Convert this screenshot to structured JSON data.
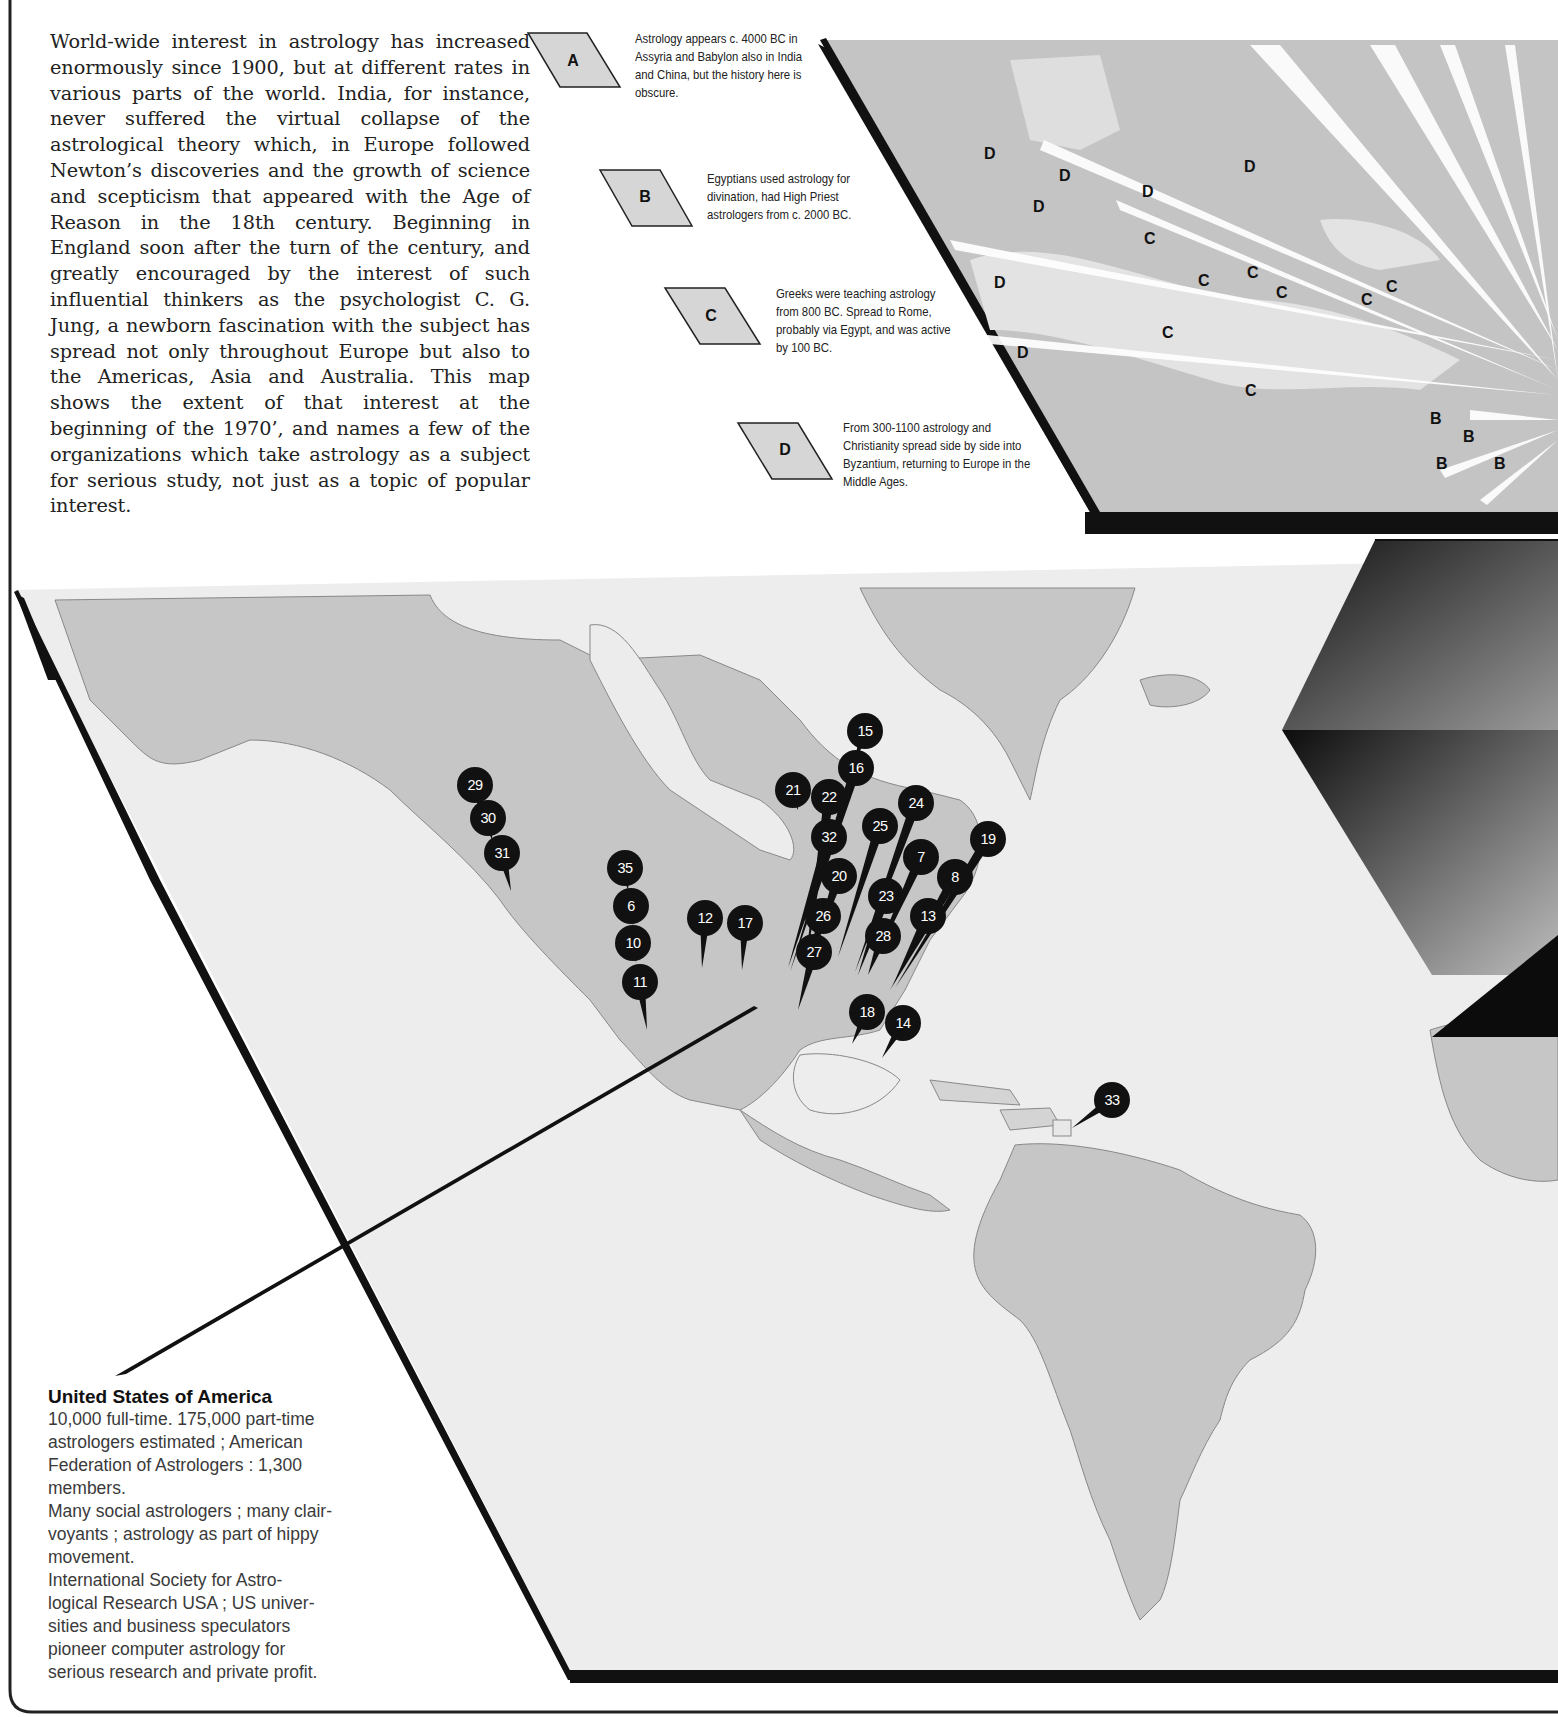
{
  "intro": {
    "paragraph": "World-wide interest in astrology has increased enormously since 1900, but at different rates in various parts of the world. India, for instance, never suffered the virtual collapse of the astrological theory which, in Europe followed Newton’s discoveries and the growth of science and scepticism that appeared with the Age of Reason in the 18th century. Beginning in England soon after the turn of the century, and greatly encouraged by the interest of such influential thinkers as the psychologist C. G. Jung, a newborn fascination with the subject has spread not only throughout Europe but also to the Americas, Asia and Australia. This map shows the extent of that interest at the beginning of the 1970’, and names a few of the organizations which take astrology as a subject for serious study, not just as a topic of popular interest."
  },
  "key": [
    {
      "letter": "A",
      "text": "Astrology appears c. 4000 BC in Assyria and Babylon also in India and China, but the history here is obscure."
    },
    {
      "letter": "B",
      "text": "Egyptians used astrology for divination, had High Priest astrologers from c. 2000 BC."
    },
    {
      "letter": "C",
      "text": "Greeks were teaching astrology from 800 BC. Spread to Rome, probably via Egypt, and was active by 100 BC."
    },
    {
      "letter": "D",
      "text": "From 300-1100 astrology and Christianity spread side by side into Byzantium, returning to Europe in the Middle Ages."
    }
  ],
  "europe_map": {
    "labels": [
      {
        "letter": "D",
        "x": 990,
        "y": 155
      },
      {
        "letter": "D",
        "x": 1065,
        "y": 177
      },
      {
        "letter": "D",
        "x": 1148,
        "y": 193
      },
      {
        "letter": "D",
        "x": 1039,
        "y": 208
      },
      {
        "letter": "D",
        "x": 1250,
        "y": 168
      },
      {
        "letter": "D",
        "x": 1000,
        "y": 284
      },
      {
        "letter": "D",
        "x": 1023,
        "y": 354
      },
      {
        "letter": "C",
        "x": 1150,
        "y": 240
      },
      {
        "letter": "C",
        "x": 1204,
        "y": 282
      },
      {
        "letter": "C",
        "x": 1253,
        "y": 274
      },
      {
        "letter": "C",
        "x": 1282,
        "y": 294
      },
      {
        "letter": "C",
        "x": 1367,
        "y": 301
      },
      {
        "letter": "C",
        "x": 1392,
        "y": 288
      },
      {
        "letter": "C",
        "x": 1168,
        "y": 334
      },
      {
        "letter": "C",
        "x": 1251,
        "y": 392
      },
      {
        "letter": "B",
        "x": 1436,
        "y": 420
      },
      {
        "letter": "B",
        "x": 1469,
        "y": 438
      },
      {
        "letter": "B",
        "x": 1442,
        "y": 465
      },
      {
        "letter": "B",
        "x": 1500,
        "y": 465
      }
    ]
  },
  "americas_map": {
    "pins": [
      {
        "n": "29",
        "x": 475,
        "y": 785,
        "tx": 480,
        "ty": 810
      },
      {
        "n": "30",
        "x": 488,
        "y": 818,
        "tx": 492,
        "ty": 840
      },
      {
        "n": "31",
        "x": 502,
        "y": 853,
        "tx": 511,
        "ty": 891
      },
      {
        "n": "35",
        "x": 625,
        "y": 868,
        "tx": 628,
        "ty": 890
      },
      {
        "n": "6",
        "x": 631,
        "y": 906,
        "tx": 633,
        "ty": 925
      },
      {
        "n": "10",
        "x": 633,
        "y": 943,
        "tx": 636,
        "ty": 962
      },
      {
        "n": "11",
        "x": 640,
        "y": 982,
        "tx": 647,
        "ty": 1030
      },
      {
        "n": "12",
        "x": 705,
        "y": 918,
        "tx": 702,
        "ty": 968
      },
      {
        "n": "17",
        "x": 745,
        "y": 923,
        "tx": 742,
        "ty": 970
      },
      {
        "n": "15",
        "x": 865,
        "y": 731,
        "tx": 855,
        "ty": 760
      },
      {
        "n": "16",
        "x": 856,
        "y": 768,
        "tx": 790,
        "ty": 972
      },
      {
        "n": "21",
        "x": 793,
        "y": 790,
        "tx": 798,
        "ty": 810
      },
      {
        "n": "22",
        "x": 829,
        "y": 797,
        "tx": 805,
        "ty": 968
      },
      {
        "n": "32",
        "x": 829,
        "y": 837,
        "tx": 788,
        "ty": 968
      },
      {
        "n": "20",
        "x": 839,
        "y": 876,
        "tx": 810,
        "ty": 960
      },
      {
        "n": "26",
        "x": 823,
        "y": 916,
        "tx": 808,
        "ty": 965
      },
      {
        "n": "27",
        "x": 814,
        "y": 952,
        "tx": 798,
        "ty": 1010
      },
      {
        "n": "25",
        "x": 880,
        "y": 826,
        "tx": 838,
        "ty": 957
      },
      {
        "n": "24",
        "x": 916,
        "y": 803,
        "tx": 855,
        "ty": 972
      },
      {
        "n": "7",
        "x": 921,
        "y": 857,
        "tx": 870,
        "ty": 970
      },
      {
        "n": "23",
        "x": 886,
        "y": 896,
        "tx": 858,
        "ty": 975
      },
      {
        "n": "28",
        "x": 883,
        "y": 936,
        "tx": 868,
        "ty": 975
      },
      {
        "n": "19",
        "x": 988,
        "y": 839,
        "tx": 895,
        "ty": 988
      },
      {
        "n": "8",
        "x": 955,
        "y": 877,
        "tx": 890,
        "ty": 990
      },
      {
        "n": "13",
        "x": 928,
        "y": 916,
        "tx": 893,
        "ty": 985
      },
      {
        "n": "18",
        "x": 867,
        "y": 1012,
        "tx": 852,
        "ty": 1044
      },
      {
        "n": "14",
        "x": 903,
        "y": 1023,
        "tx": 882,
        "ty": 1058
      },
      {
        "n": "33",
        "x": 1112,
        "y": 1100,
        "tx": 1072,
        "ty": 1128
      }
    ]
  },
  "usa_panel": {
    "title": "United States of America",
    "lines": [
      "10,000 full-time. 175,000 part-time",
      "astrologers estimated ; American",
      "Federation of Astrologers : 1,300",
      "members.",
      "Many social astrologers ; many clair-",
      "voyants ; astrology as part of hippy",
      "movement.",
      "International Society for Astro-",
      "logical Research USA ; US univer-",
      "sities and business speculators",
      "pioneer computer astrology for",
      "serious research and private profit."
    ]
  },
  "colors": {
    "land": "#c9c9c9",
    "sea": "#ececec",
    "pin": "#111111",
    "ink": "#222222"
  }
}
